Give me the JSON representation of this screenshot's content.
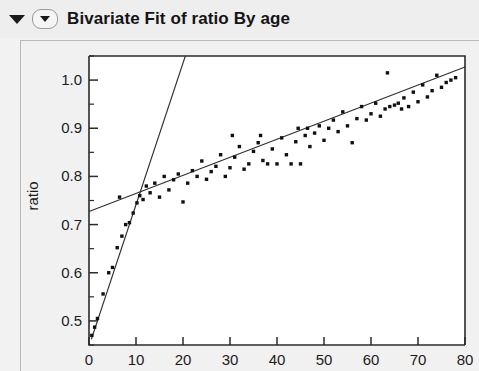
{
  "window": {
    "title": "Bivariate Fit of ratio By age",
    "outline_triangle_icon": "triangle-down-icon",
    "disclosure_icon": "disclosure-triangle-down-icon"
  },
  "chart_data": {
    "type": "scatter",
    "title": "Bivariate Fit of ratio By age",
    "xlabel": "age",
    "ylabel": "ratio",
    "xlim": [
      0,
      80
    ],
    "ylim": [
      0.45,
      1.05
    ],
    "x_ticks": [
      0,
      10,
      20,
      30,
      40,
      50,
      60,
      70,
      80
    ],
    "x_tick_labels": [
      "0",
      "10",
      "20",
      "30",
      "40",
      "50",
      "60",
      "70",
      "80"
    ],
    "y_ticks": [
      0.5,
      0.6,
      0.7,
      0.8,
      0.9,
      1.0
    ],
    "y_tick_labels": [
      "0.5",
      "0.6",
      "0.7",
      "0.8",
      "0.9",
      "1.0"
    ],
    "y_minor_ticks": [
      0.45,
      0.55,
      0.65,
      0.75,
      0.85,
      0.95,
      1.05
    ],
    "grid": false,
    "legend": false,
    "point_color": "#101010",
    "line_color": "#2e2e2e",
    "series": [
      {
        "name": "ratio by age",
        "points": [
          [
            0.6,
            0.47
          ],
          [
            1.2,
            0.487
          ],
          [
            1.8,
            0.505
          ],
          [
            3.0,
            0.556
          ],
          [
            4.2,
            0.6
          ],
          [
            5.0,
            0.611
          ],
          [
            6.0,
            0.652
          ],
          [
            7.0,
            0.676
          ],
          [
            7.8,
            0.7
          ],
          [
            8.6,
            0.704
          ],
          [
            9.4,
            0.724
          ],
          [
            10.2,
            0.745
          ],
          [
            10.8,
            0.76
          ],
          [
            11.5,
            0.752
          ],
          [
            12.2,
            0.78
          ],
          [
            13.0,
            0.766
          ],
          [
            6.5,
            0.757
          ],
          [
            14.0,
            0.786
          ],
          [
            15.0,
            0.757
          ],
          [
            16.0,
            0.8
          ],
          [
            17.0,
            0.772
          ],
          [
            18.0,
            0.793
          ],
          [
            19.0,
            0.805
          ],
          [
            20.0,
            0.747
          ],
          [
            21.0,
            0.786
          ],
          [
            22.0,
            0.812
          ],
          [
            23.0,
            0.8
          ],
          [
            24.0,
            0.832
          ],
          [
            25.0,
            0.794
          ],
          [
            26.0,
            0.81
          ],
          [
            27.0,
            0.821
          ],
          [
            28.0,
            0.845
          ],
          [
            29.0,
            0.8
          ],
          [
            30.0,
            0.818
          ],
          [
            31.0,
            0.84
          ],
          [
            32.0,
            0.862
          ],
          [
            33.0,
            0.815
          ],
          [
            34.0,
            0.826
          ],
          [
            35.0,
            0.852
          ],
          [
            36.0,
            0.87
          ],
          [
            37.0,
            0.833
          ],
          [
            38.0,
            0.826
          ],
          [
            39.0,
            0.857
          ],
          [
            40.0,
            0.826
          ],
          [
            41.0,
            0.88
          ],
          [
            42.0,
            0.845
          ],
          [
            43.0,
            0.826
          ],
          [
            44.0,
            0.872
          ],
          [
            45.0,
            0.826
          ],
          [
            46.0,
            0.885
          ],
          [
            47.0,
            0.862
          ],
          [
            48.0,
            0.89
          ],
          [
            49.0,
            0.905
          ],
          [
            50.0,
            0.875
          ],
          [
            51.0,
            0.9
          ],
          [
            52.0,
            0.917
          ],
          [
            53.0,
            0.893
          ],
          [
            54.0,
            0.934
          ],
          [
            55.0,
            0.905
          ],
          [
            56.0,
            0.87
          ],
          [
            57.0,
            0.92
          ],
          [
            58.0,
            0.945
          ],
          [
            59.0,
            0.917
          ],
          [
            60.0,
            0.93
          ],
          [
            61.0,
            0.952
          ],
          [
            62.0,
            0.925
          ],
          [
            63.0,
            0.94
          ],
          [
            64.0,
            0.945
          ],
          [
            65.0,
            0.948
          ],
          [
            65.8,
            0.952
          ],
          [
            66.5,
            0.94
          ],
          [
            67.0,
            0.963
          ],
          [
            68.0,
            0.945
          ],
          [
            69.0,
            0.975
          ],
          [
            70.0,
            0.955
          ],
          [
            71.0,
            0.99
          ],
          [
            72.0,
            0.965
          ],
          [
            73.0,
            0.978
          ],
          [
            74.0,
            1.01
          ],
          [
            75.0,
            0.985
          ],
          [
            76.0,
            0.995
          ],
          [
            77.0,
            1.0
          ],
          [
            78.0,
            1.005
          ],
          [
            63.5,
            1.015
          ],
          [
            44.5,
            0.9
          ],
          [
            46.5,
            0.9
          ],
          [
            36.5,
            0.885
          ],
          [
            30.5,
            0.885
          ]
        ]
      }
    ],
    "fits": [
      {
        "name": "linear-fit-shallow",
        "x_start": 0,
        "y_start": 0.727,
        "x_end": 80,
        "y_end": 1.027
      },
      {
        "name": "linear-fit-steep",
        "x_start": 0.5,
        "y_start": 0.462,
        "x_end": 20.5,
        "y_end": 1.05
      }
    ]
  }
}
